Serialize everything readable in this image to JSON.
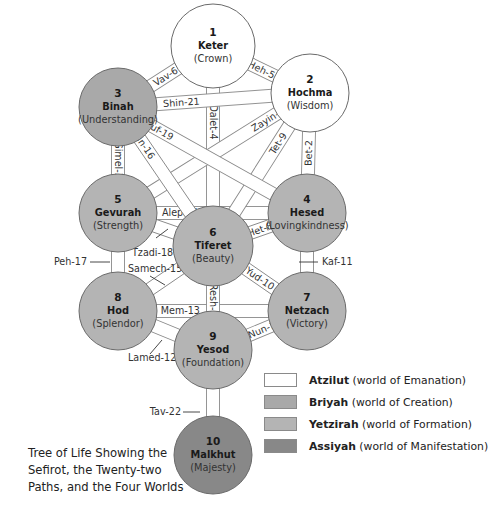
{
  "title": "Tree of Life Showing the Sefirot, the Twenty-two Paths, and the Four Worlds",
  "caption_lines": [
    "Tree of Life Showing the",
    "Sefirot, the Twenty-two",
    "Paths, and the Four Worlds"
  ],
  "colors": {
    "atzilut": "#ffffff",
    "briyah": "#a9a9a9",
    "yetzirah": "#b4b4b4",
    "assiyah": "#888888",
    "stroke": "#8a8a8a"
  },
  "sefirot": [
    {
      "num": "1",
      "name": "Keter",
      "meaning": "(Crown)",
      "world": "atzilut"
    },
    {
      "num": "2",
      "name": "Hochma",
      "meaning": "(Wisdom)",
      "world": "atzilut"
    },
    {
      "num": "3",
      "name": "Binah",
      "meaning": "(Understanding)",
      "world": "briyah"
    },
    {
      "num": "4",
      "name": "Hesed",
      "meaning": "(Lovingkindness)",
      "world": "yetzirah"
    },
    {
      "num": "5",
      "name": "Gevurah",
      "meaning": "(Strength)",
      "world": "yetzirah"
    },
    {
      "num": "6",
      "name": "Tiferet",
      "meaning": "(Beauty)",
      "world": "yetzirah"
    },
    {
      "num": "7",
      "name": "Netzach",
      "meaning": "(Victory)",
      "world": "yetzirah"
    },
    {
      "num": "8",
      "name": "Hod",
      "meaning": "(Splendor)",
      "world": "yetzirah"
    },
    {
      "num": "9",
      "name": "Yesod",
      "meaning": "(Foundation)",
      "world": "yetzirah"
    },
    {
      "num": "10",
      "name": "Malkhut",
      "meaning": "(Majesty)",
      "world": "assiyah"
    }
  ],
  "paths": [
    {
      "label": "Aleph-1",
      "from": "5",
      "to": "4"
    },
    {
      "label": "Bet-2",
      "from": "2",
      "to": "4"
    },
    {
      "label": "Gimel-3",
      "from": "3",
      "to": "5"
    },
    {
      "label": "Dalet-4",
      "from": "1",
      "to": "6"
    },
    {
      "label": "Heh-5",
      "from": "1",
      "to": "2"
    },
    {
      "label": "Vav-6",
      "from": "1",
      "to": "3"
    },
    {
      "label": "Zayin-7",
      "from": "2",
      "to": "5"
    },
    {
      "label": "Het-8",
      "from": "6",
      "to": "4"
    },
    {
      "label": "Tet-9",
      "from": "2",
      "to": "6"
    },
    {
      "label": "Yud-10",
      "from": "6",
      "to": "7"
    },
    {
      "label": "Kaf-11",
      "from": "4",
      "to": "7"
    },
    {
      "label": "Lamed-12",
      "from": "8",
      "to": "9"
    },
    {
      "label": "Mem-13",
      "from": "8",
      "to": "7"
    },
    {
      "label": "Nun-14",
      "from": "9",
      "to": "7"
    },
    {
      "label": "Samech-15",
      "from": "8",
      "to": "6"
    },
    {
      "label": "Ayin-16",
      "from": "3",
      "to": "6"
    },
    {
      "label": "Peh-17",
      "from": "5",
      "to": "8"
    },
    {
      "label": "Tzadi-18",
      "from": "5",
      "to": "6"
    },
    {
      "label": "Kuf-19",
      "from": "3",
      "to": "4"
    },
    {
      "label": "Resh-20",
      "from": "6",
      "to": "9"
    },
    {
      "label": "Shin-21",
      "from": "3",
      "to": "2"
    },
    {
      "label": "Tav-22",
      "from": "9",
      "to": "10"
    }
  ],
  "legend": [
    {
      "key": "atzilut",
      "name": "Atzilut",
      "desc": "(world of Emanation)"
    },
    {
      "key": "briyah",
      "name": "Briyah",
      "desc": "(world of Creation)"
    },
    {
      "key": "yetzirah",
      "name": "Yetzirah",
      "desc": "(world of Formation)"
    },
    {
      "key": "assiyah",
      "name": "Assiyah",
      "desc": "(world of Manifestation)"
    }
  ]
}
